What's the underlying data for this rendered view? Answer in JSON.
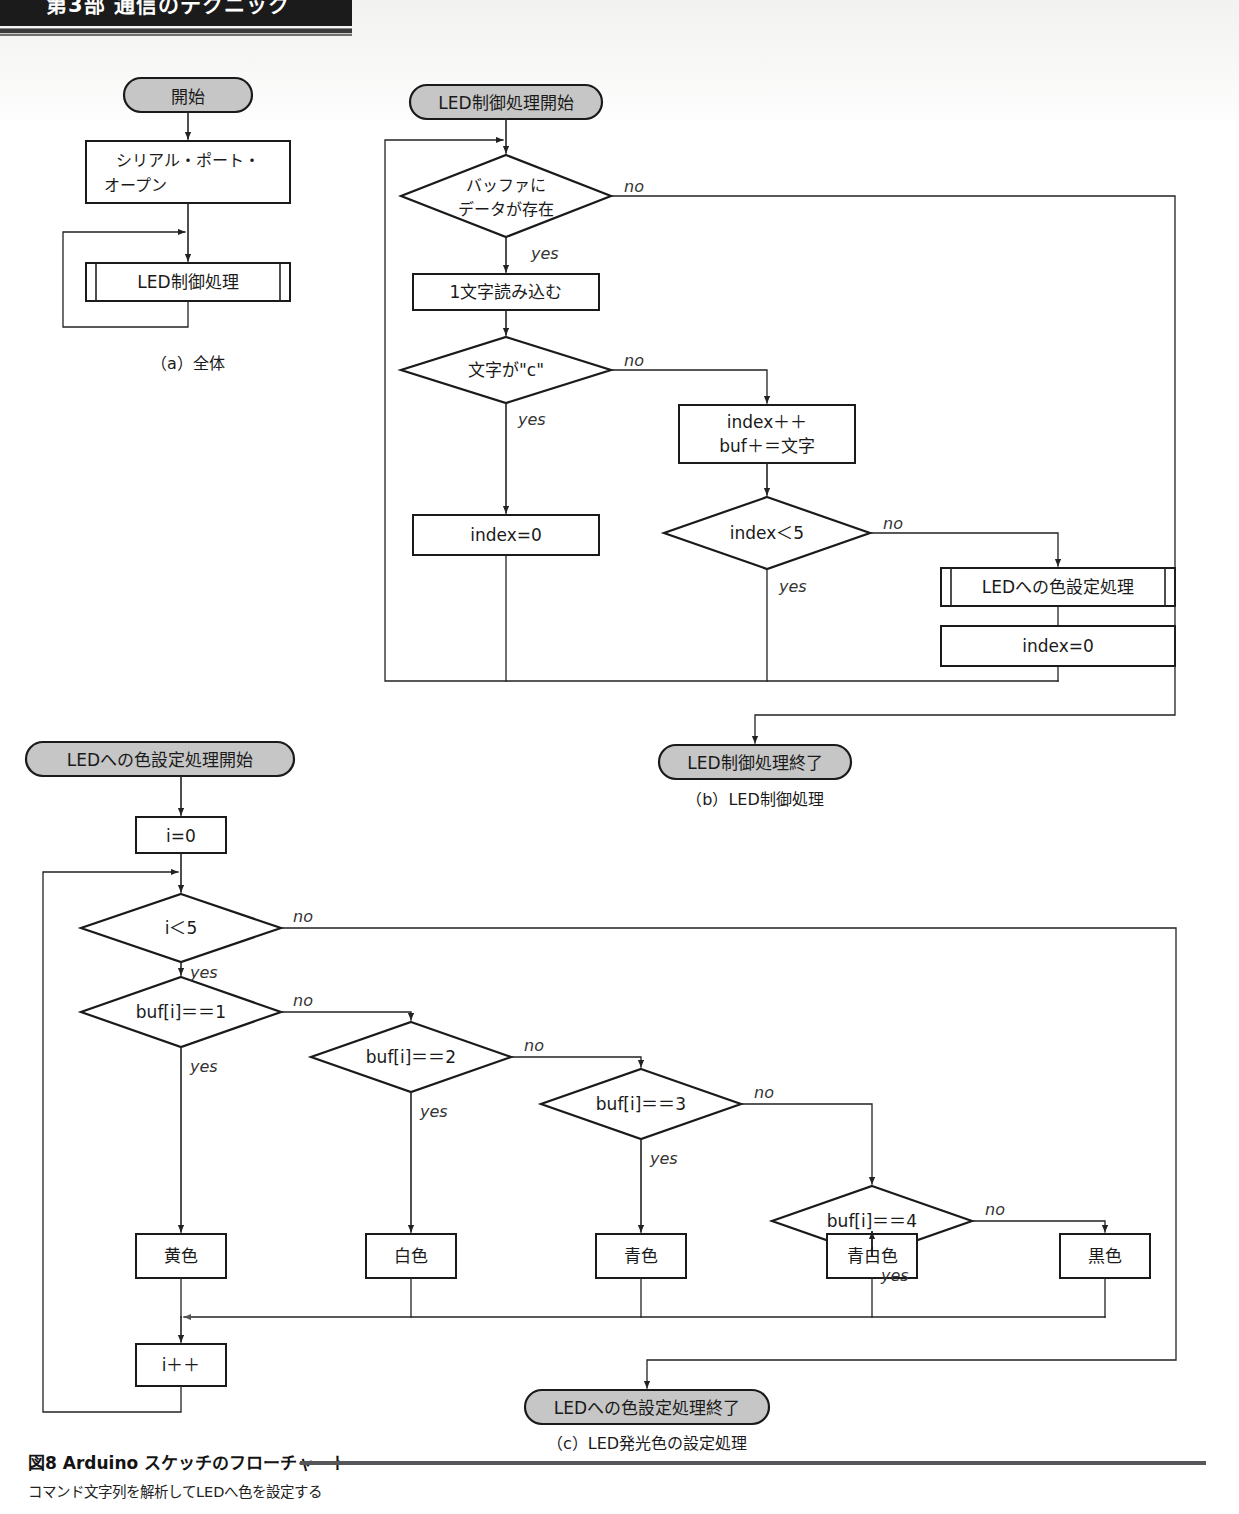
{
  "header": {
    "running_title": "第3部  通信のテクニック"
  },
  "figure": {
    "caption_main": "図8 Arduino スケッチのフローチャート",
    "caption_sub": "コマンド文字列を解析してLEDへ色を設定する"
  },
  "labels": {
    "yes": "yes",
    "no": "no"
  },
  "colors": {
    "terminal_fill": "#c6c6c6",
    "process_fill": "#ffffff",
    "stroke": "#1a1a1a",
    "line": "#444444"
  },
  "panel_a": {
    "sub_caption": "（a）全体",
    "nodes": {
      "start": "開始",
      "serial_open": "シリアル・ポート・\nオープン",
      "serial_open_l1": "シリアル・ポート・",
      "serial_open_l2": "オープン",
      "led_control": "LED制御処理"
    }
  },
  "panel_b": {
    "sub_caption": "（b）LED制御処理",
    "nodes": {
      "start": "LED制御処理開始",
      "buffer_has_data_l1": "バッファに",
      "buffer_has_data_l2": "データが存在",
      "read_one_char": "1文字読み込む",
      "char_is_c": "文字が\"c\"",
      "index_reset": "index=0",
      "index_inc_l1": "index＋＋",
      "index_inc_l2": "buf＋＝文字",
      "index_lt5": "index＜5",
      "led_color_proc": "LEDへの色設定処理",
      "index_reset2": "index=0",
      "end": "LED制御処理終了"
    }
  },
  "panel_c": {
    "sub_caption": "（c）LED発光色の設定処理",
    "nodes": {
      "start": "LEDへの色設定処理開始",
      "i_init": "i=0",
      "i_lt5": "i＜5",
      "buf_eq1": "buf[i]＝＝1",
      "buf_eq2": "buf[i]＝＝2",
      "buf_eq3": "buf[i]＝＝3",
      "buf_eq4": "buf[i]＝＝4",
      "color_yellow": "黄色",
      "color_white": "白色",
      "color_blue": "青色",
      "color_paleblue": "青白色",
      "color_black": "黒色",
      "i_inc": "i＋＋",
      "end": "LEDへの色設定処理終了"
    }
  }
}
